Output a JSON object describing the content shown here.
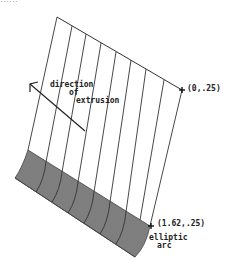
{
  "caption": "……",
  "diagram": {
    "labels": {
      "direction_line1": "direction",
      "direction_line2": "of",
      "direction_line3": "extrusion",
      "top_point": "(0,.25)",
      "bottom_point": "(1.62,.25)",
      "curve_line1": "elliptic",
      "curve_line2": "arc"
    },
    "colors": {
      "line": "#333333",
      "surface": "#777777",
      "surface_dark": "#444444"
    }
  }
}
